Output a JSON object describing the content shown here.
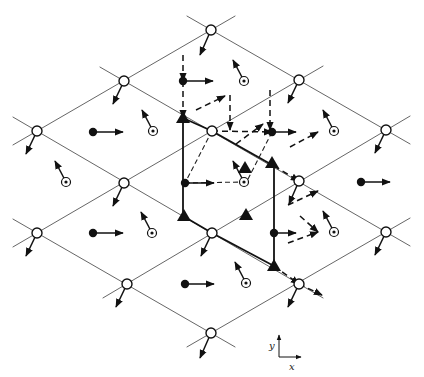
{
  "figure": {
    "type": "lattice-spin-diagram",
    "axes": {
      "x_label": "x",
      "y_label": "y",
      "origin": [
        279,
        357
      ]
    },
    "lattice_nodes": [
      [
        211,
        30
      ],
      [
        124,
        81
      ],
      [
        299,
        80
      ],
      [
        37,
        131
      ],
      [
        212,
        131
      ],
      [
        386,
        130
      ],
      [
        124,
        183
      ],
      [
        299,
        181
      ],
      [
        37,
        233
      ],
      [
        212,
        233
      ],
      [
        386,
        232
      ],
      [
        127,
        284
      ],
      [
        299,
        284
      ],
      [
        211,
        333
      ]
    ],
    "node_arrows": [
      [
        211,
        30,
        200,
        55
      ],
      [
        124,
        81,
        113,
        104
      ],
      [
        299,
        80,
        288,
        103
      ],
      [
        37,
        131,
        26,
        154
      ],
      [
        386,
        130,
        375,
        153
      ],
      [
        124,
        183,
        113,
        206
      ],
      [
        299,
        181,
        289,
        204
      ],
      [
        37,
        233,
        26,
        256
      ],
      [
        212,
        233,
        201,
        256
      ],
      [
        386,
        232,
        375,
        255
      ],
      [
        127,
        284,
        116,
        307
      ],
      [
        299,
        284,
        288,
        307
      ],
      [
        211,
        333,
        200,
        358
      ]
    ],
    "filled_dots": [
      {
        "at": [
          93,
          132
        ],
        "arrow_to": [
          123,
          132
        ]
      },
      {
        "at": [
          93,
          233
        ],
        "arrow_to": [
          123,
          233
        ]
      },
      {
        "at": [
          183,
          81
        ],
        "arrow_to": [
          213,
          81
        ]
      },
      {
        "at": [
          272,
          132
        ],
        "arrow_to": [
          296,
          132
        ]
      },
      {
        "at": [
          185,
          183
        ],
        "arrow_to": [
          214,
          183
        ]
      },
      {
        "at": [
          274,
          233
        ],
        "arrow_to": [
          296,
          233
        ]
      },
      {
        "at": [
          185,
          284
        ],
        "arrow_to": [
          214,
          284
        ]
      },
      {
        "at": [
          361,
          182
        ],
        "arrow_to": [
          390,
          182
        ]
      }
    ],
    "target_dots": [
      {
        "at": [
          153,
          131
        ],
        "arrow_to": [
          142,
          110
        ]
      },
      {
        "at": [
          66,
          182
        ],
        "arrow_to": [
          55,
          161
        ]
      },
      {
        "at": [
          244,
          81
        ],
        "arrow_to": [
          233,
          60
        ]
      },
      {
        "at": [
          244,
          182
        ],
        "arrow_to": [
          233,
          161
        ]
      },
      {
        "at": [
          334,
          131
        ],
        "arrow_to": [
          323,
          110
        ]
      },
      {
        "at": [
          152,
          233
        ],
        "arrow_to": [
          141,
          212
        ]
      },
      {
        "at": [
          334,
          232
        ],
        "arrow_to": [
          323,
          211
        ]
      },
      {
        "at": [
          246,
          283
        ],
        "arrow_to": [
          235,
          262
        ]
      }
    ],
    "triangles": [
      [
        183,
        118
      ],
      [
        272,
        163
      ],
      [
        245,
        168
      ],
      [
        184,
        216
      ],
      [
        246,
        215
      ],
      [
        274,
        266
      ]
    ],
    "solid_bonds": [
      [
        [
          183,
          118
        ],
        [
          183,
          216
        ]
      ],
      [
        [
          183,
          118
        ],
        [
          212,
          131
        ]
      ],
      [
        [
          183,
          216
        ],
        [
          212,
          233
        ]
      ],
      [
        [
          274,
          166
        ],
        [
          274,
          266
        ]
      ],
      [
        [
          212,
          131
        ],
        [
          274,
          166
        ]
      ],
      [
        [
          212,
          233
        ],
        [
          274,
          266
        ]
      ]
    ],
    "dashed_arrows": [
      [
        [
          183,
          81
        ],
        [
          183,
          118
        ]
      ],
      [
        [
          183,
          55
        ],
        [
          183,
          81
        ]
      ],
      [
        [
          196,
          110
        ],
        [
          225,
          96
        ]
      ],
      [
        [
          230,
          95
        ],
        [
          230,
          130
        ]
      ],
      [
        [
          212,
          131
        ],
        [
          272,
          132
        ]
      ],
      [
        [
          270,
          90
        ],
        [
          270,
          130
        ]
      ],
      [
        [
          236,
          144
        ],
        [
          263,
          124
        ]
      ],
      [
        [
          290,
          147
        ],
        [
          318,
          132
        ]
      ],
      [
        [
          274,
          166
        ],
        [
          299,
          181
        ]
      ],
      [
        [
          288,
          205
        ],
        [
          318,
          191
        ]
      ],
      [
        [
          300,
          216
        ],
        [
          318,
          232
        ]
      ],
      [
        [
          288,
          243
        ],
        [
          318,
          232
        ]
      ],
      [
        [
          274,
          266
        ],
        [
          299,
          284
        ]
      ],
      [
        [
          299,
          284
        ],
        [
          322,
          295
        ]
      ]
    ],
    "thin_dashed": [
      [
        [
          212,
          131
        ],
        [
          185,
          183
        ]
      ],
      [
        [
          272,
          132
        ],
        [
          246,
          183
        ]
      ],
      [
        [
          185,
          183
        ],
        [
          244,
          182
        ]
      ]
    ]
  }
}
